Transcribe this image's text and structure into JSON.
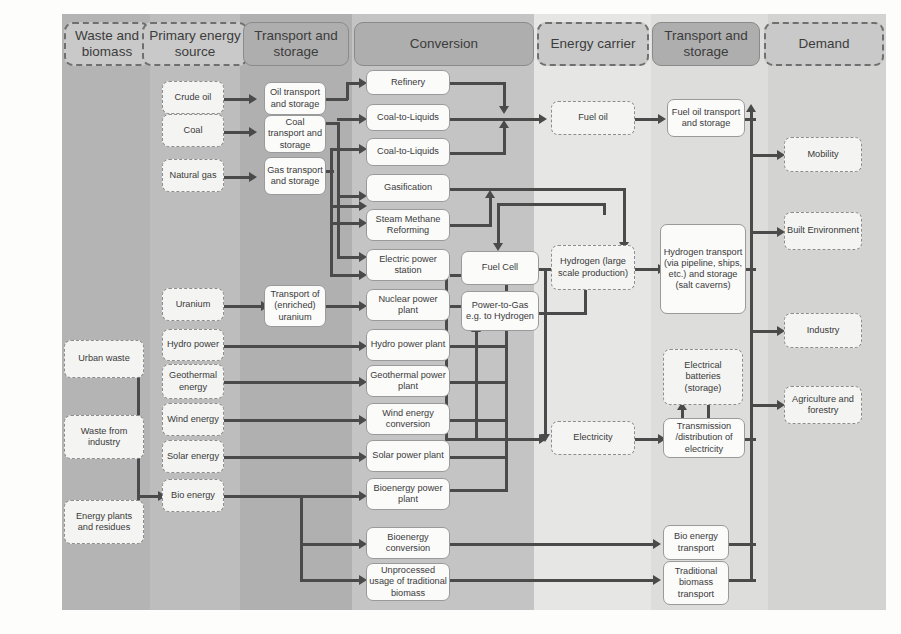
{
  "diagram": {
    "colors": {
      "band_waste": "#b4b4b4",
      "band_primary": "#bdbdbd",
      "band_transport1": "#b0b0b0",
      "band_conversion": "#c4c4c4",
      "band_carrier": "#e4e4e2",
      "band_transport2": "#dcdcda",
      "band_demand": "#d2d2d0",
      "header_dash_fill": "#c9c9c9",
      "header_solid_fill": "#aeaeae",
      "node_dash_fill": "#f4f4f2",
      "node_solid_fill": "#fbfbfa",
      "line": "#4a4a4a"
    },
    "headers": [
      {
        "id": "waste",
        "label": "Waste and biomass",
        "style": "dash"
      },
      {
        "id": "primary",
        "label": "Primary energy source",
        "style": "dash"
      },
      {
        "id": "transport1",
        "label": "Transport and storage",
        "style": "solid"
      },
      {
        "id": "conversion",
        "label": "Conversion",
        "style": "solid"
      },
      {
        "id": "carrier",
        "label": "Energy carrier",
        "style": "dash"
      },
      {
        "id": "transport2",
        "label": "Transport and storage",
        "style": "solid"
      },
      {
        "id": "demand",
        "label": "Demand",
        "style": "dash"
      }
    ],
    "nodes": {
      "waste": [
        {
          "id": "urban-waste",
          "label": "Urban waste"
        },
        {
          "id": "waste-from-industry",
          "label": "Waste from industry"
        },
        {
          "id": "energy-plants",
          "label": "Energy plants and residues"
        }
      ],
      "primary": [
        {
          "id": "crude-oil",
          "label": "Crude oil"
        },
        {
          "id": "coal",
          "label": "Coal"
        },
        {
          "id": "natural-gas",
          "label": "Natural gas"
        },
        {
          "id": "uranium",
          "label": "Uranium"
        },
        {
          "id": "hydro-power",
          "label": "Hydro power"
        },
        {
          "id": "geothermal-energy",
          "label": "Geothermal energy"
        },
        {
          "id": "wind-energy",
          "label": "Wind energy"
        },
        {
          "id": "solar-energy",
          "label": "Solar energy"
        },
        {
          "id": "bio-energy",
          "label": "Bio energy"
        }
      ],
      "transport1": [
        {
          "id": "oil-transport",
          "label": "Oil transport and storage"
        },
        {
          "id": "coal-transport",
          "label": "Coal transport and storage"
        },
        {
          "id": "gas-transport",
          "label": "Gas transport and storage"
        },
        {
          "id": "uranium-transport",
          "label": "Transport of (enriched) uranium"
        }
      ],
      "conversion": [
        {
          "id": "refinery",
          "label": "Refinery"
        },
        {
          "id": "coal-to-liquids-1",
          "label": "Coal-to-Liquids"
        },
        {
          "id": "coal-to-liquids-2",
          "label": "Coal-to-Liquids"
        },
        {
          "id": "gasification",
          "label": "Gasification"
        },
        {
          "id": "steam-methane-reforming",
          "label": "Steam Methane Reforming"
        },
        {
          "id": "electric-power-station",
          "label": "Electric power station"
        },
        {
          "id": "nuclear-power-plant",
          "label": "Nuclear power plant"
        },
        {
          "id": "hydro-power-plant",
          "label": "Hydro power plant"
        },
        {
          "id": "geothermal-power-plant",
          "label": "Geothermal power plant"
        },
        {
          "id": "wind-energy-conversion",
          "label": "Wind energy conversion"
        },
        {
          "id": "solar-power-plant",
          "label": "Solar power plant"
        },
        {
          "id": "bioenergy-power-plant",
          "label": "Bioenergy power plant"
        },
        {
          "id": "bioenergy-conversion",
          "label": "Bioenergy conversion"
        },
        {
          "id": "unprocessed-biomass",
          "label": "Unprocessed usage of traditional biomass"
        },
        {
          "id": "fuel-cell",
          "label": "Fuel Cell"
        },
        {
          "id": "power-to-gas",
          "label": "Power-to-Gas e.g. to Hydrogen"
        }
      ],
      "carrier": [
        {
          "id": "fuel-oil",
          "label": "Fuel oil"
        },
        {
          "id": "hydrogen",
          "label": "Hydrogen (large scale production)"
        },
        {
          "id": "electricity",
          "label": "Electricity"
        }
      ],
      "transport2": [
        {
          "id": "fuel-oil-transport",
          "label": "Fuel oil transport and storage"
        },
        {
          "id": "hydrogen-transport",
          "label": "Hydrogen transport (via pipeline, ships, etc.) and storage (salt caverns)"
        },
        {
          "id": "electrical-batteries",
          "label": "Electrical batteries (storage)"
        },
        {
          "id": "transmission-distribution",
          "label": "Transmission /distribution of electricity"
        },
        {
          "id": "bio-energy-transport",
          "label": "Bio energy transport"
        },
        {
          "id": "traditional-biomass-transport",
          "label": "Traditional biomass transport"
        }
      ],
      "demand": [
        {
          "id": "mobility",
          "label": "Mobility"
        },
        {
          "id": "built-environment",
          "label": "Built Environment"
        },
        {
          "id": "industry",
          "label": "Industry"
        },
        {
          "id": "agriculture-forestry",
          "label": "Agriculture and forestry"
        }
      ]
    }
  }
}
